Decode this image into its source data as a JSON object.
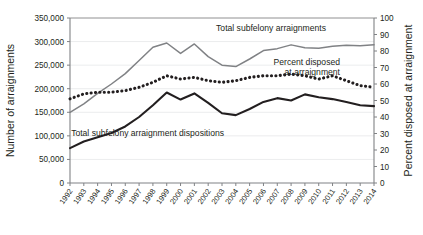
{
  "chart_data": {
    "type": "line",
    "title": "",
    "xlabel": "",
    "ylabel": "Number of arraignments",
    "y2label": "Percent disposed at arraignment",
    "ylim": [
      0,
      350000
    ],
    "y2lim": [
      0,
      100
    ],
    "grid": true,
    "legend_position": "inline-annotations",
    "categories": [
      "1992",
      "1993",
      "1994",
      "1995",
      "1996",
      "1997",
      "1998",
      "1999",
      "2000",
      "2001",
      "2002",
      "2003",
      "2004",
      "2005",
      "2006",
      "2007",
      "2008",
      "2009",
      "2010",
      "2011",
      "2012",
      "2013",
      "2014"
    ],
    "yticks": [
      "0",
      "50,000",
      "100,000",
      "150,000",
      "200,000",
      "250,000",
      "300,000",
      "350,000"
    ],
    "y2ticks": [
      "0",
      "10",
      "20",
      "30",
      "40",
      "50",
      "60",
      "70",
      "80",
      "90",
      "100"
    ],
    "series": [
      {
        "name": "Total subfelony arraignments",
        "axis": "left",
        "style": "solid-gray",
        "color": "#808285",
        "values": [
          150000,
          168000,
          190000,
          210000,
          232000,
          260000,
          288000,
          297000,
          275000,
          295000,
          268000,
          250000,
          247000,
          263000,
          281000,
          285000,
          293000,
          287000,
          286000,
          290000,
          292000,
          291000,
          293000
        ]
      },
      {
        "name": "Percent disposed at arraignment",
        "axis": "right",
        "style": "dotted-black",
        "color": "#231f20",
        "values": [
          51,
          54,
          55,
          55,
          56,
          58,
          61,
          65,
          63,
          64,
          62,
          61,
          62,
          64,
          65,
          65,
          66,
          65,
          63,
          65,
          62,
          59,
          58
        ]
      },
      {
        "name": "Total subfelony arraignment dispositions",
        "axis": "left",
        "style": "solid-black",
        "color": "#231f20",
        "values": [
          74000,
          88000,
          97000,
          106000,
          120000,
          140000,
          165000,
          192000,
          177000,
          190000,
          170000,
          148000,
          144000,
          157000,
          172000,
          180000,
          175000,
          188000,
          182000,
          178000,
          172000,
          165000,
          163000
        ]
      }
    ],
    "annotations": [
      {
        "text": "Total subfelony arraignments",
        "x": 271,
        "y": 31
      },
      {
        "text": "Percent disposed",
        "x": 340,
        "y": 65
      },
      {
        "text": "at arraignment",
        "x": 340,
        "y": 75
      },
      {
        "text": "Total subfelony arraignment dispositions",
        "x": 224,
        "y": 136
      }
    ]
  }
}
